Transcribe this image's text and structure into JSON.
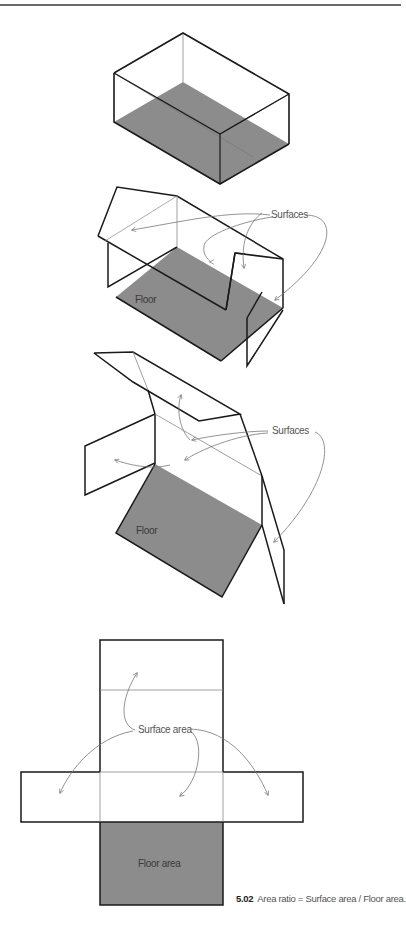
{
  "figure": {
    "number": "5.02",
    "caption": "Area ratio = Surface area / Floor area."
  },
  "panels": [
    {
      "id": "box",
      "description": "Closed box with shaded floor"
    },
    {
      "id": "unfolding-1",
      "surfaces_label": "Surfaces",
      "floor_label": "Floor"
    },
    {
      "id": "unfolding-2",
      "surfaces_label": "Surfaces",
      "floor_label": "Floor"
    },
    {
      "id": "net",
      "surface_label": "Surface area",
      "floor_label": "Floor area"
    }
  ],
  "colors": {
    "floor_fill": "#8c8c8c",
    "edge": "#1a1a1a",
    "thin_edge": "#777777",
    "arrow": "#777777"
  }
}
